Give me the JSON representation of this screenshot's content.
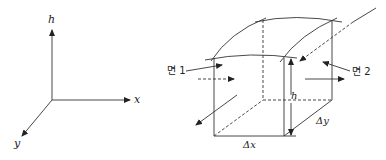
{
  "axes": {
    "h_label": "h",
    "x_label": "x",
    "y_label": "y"
  },
  "box": {
    "face1_label": "면 1",
    "face2_label": "면 2",
    "height_label": "h",
    "dx_label": "Δx",
    "dy_label": "Δy"
  },
  "colors": {
    "stroke": "#333333",
    "background": "#ffffff"
  }
}
